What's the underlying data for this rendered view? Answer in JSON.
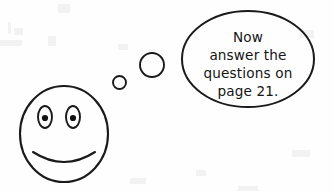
{
  "scene": {
    "width": 333,
    "height": 194,
    "background_color": "#fefefe",
    "ink_color": "#1a1a1a",
    "description": "Hand-drawn style smiley face with a thought bubble"
  },
  "thought_bubble": {
    "name": "thought-bubble",
    "shape": "ellipse",
    "center_x": 248,
    "center_y": 59,
    "radius_x": 66,
    "radius_y": 48,
    "lines": [
      {
        "text": "Now",
        "y": 42
      },
      {
        "text": "answer the",
        "y": 60
      },
      {
        "text": "questions on",
        "y": 78
      },
      {
        "text": "page 21.",
        "y": 96
      }
    ],
    "full_text": "Now answer the questions on page 21."
  },
  "thought_trail": [
    {
      "name": "thought-trail-small",
      "cx": 119.5,
      "cy": 82.5,
      "r": 6.5
    },
    {
      "name": "thought-trail-medium",
      "cx": 152,
      "cy": 65,
      "r": 12
    }
  ],
  "smiley_face": {
    "name": "smiley-face",
    "head": {
      "cx": 64,
      "cy": 134,
      "rx": 44,
      "ry": 48
    },
    "eyes": [
      {
        "name": "left-eye",
        "cx": 45,
        "cy": 117,
        "rx": 7,
        "ry": 11,
        "pupil_r": 3.1
      },
      {
        "name": "right-eye",
        "cx": 73,
        "cy": 117,
        "rx": 7,
        "ry": 11,
        "pupil_r": 3.1
      }
    ],
    "mouth": {
      "name": "smile-mouth",
      "path": "M 33 152 Q 64 172 95 152",
      "expression": "smile"
    }
  }
}
